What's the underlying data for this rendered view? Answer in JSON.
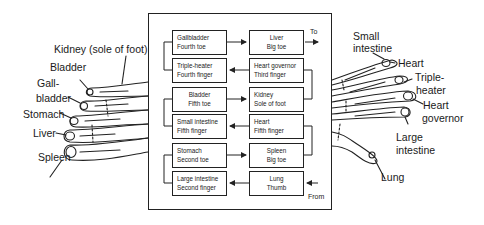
{
  "diagram": {
    "type": "meridian-flow",
    "rows": [
      {
        "left": {
          "organ": "Gallbladder",
          "site": "Fourth toe"
        },
        "right": {
          "organ": "Liver",
          "site": "Big toe"
        },
        "arrow": "left-to-right"
      },
      {
        "left": {
          "organ": "Triple-heater",
          "site": "Fourth finger"
        },
        "right": {
          "organ": "Heart governor",
          "site": "Third finger"
        },
        "arrow": "right-to-left"
      },
      {
        "left": {
          "organ": "Bladder",
          "site": "Fifth toe"
        },
        "right": {
          "organ": "Kidney",
          "site": "Sole of foot"
        },
        "arrow": "left-to-right"
      },
      {
        "left": {
          "organ": "Small intestine",
          "site": "Fifth finger"
        },
        "right": {
          "organ": "Heart",
          "site": "Fifth finger"
        },
        "arrow": "right-to-left"
      },
      {
        "left": {
          "organ": "Stomach",
          "site": "Second toe"
        },
        "right": {
          "organ": "Spleen",
          "site": "Big toe"
        },
        "arrow": "left-to-right"
      },
      {
        "left": {
          "organ": "Large intestine",
          "site": "Second finger"
        },
        "right": {
          "organ": "Lung",
          "site": "Thumb"
        },
        "arrow": "right-to-left"
      }
    ],
    "to_label": "To",
    "from_label": "From"
  },
  "foot": {
    "labels": {
      "kidney": "Kidney (sole of foot)",
      "bladder": "Bladder",
      "gallbladder_1": "Gall-",
      "gallbladder_2": "bladder",
      "stomach": "Stomach",
      "liver": "Liver",
      "spleen": "Spleen"
    }
  },
  "hand": {
    "labels": {
      "small_intestine_1": "Small",
      "small_intestine_2": "intestine",
      "heart": "Heart",
      "triple_heater_1": "Triple-",
      "triple_heater_2": "heater",
      "heart_governor_1": "Heart",
      "heart_governor_2": "governor",
      "large_intestine_1": "Large",
      "large_intestine_2": "intestine",
      "lung": "Lung"
    }
  }
}
